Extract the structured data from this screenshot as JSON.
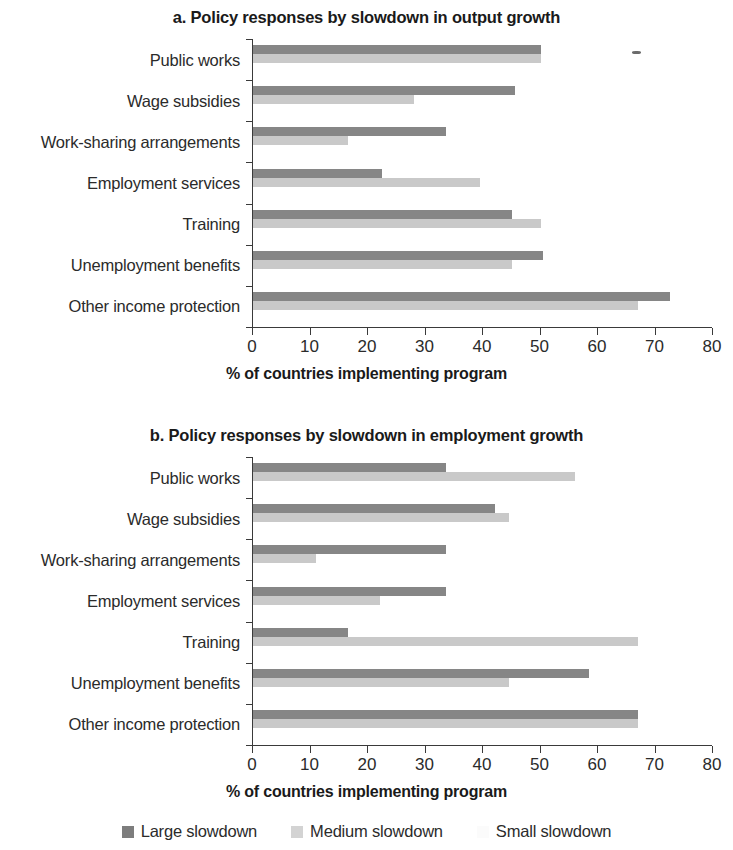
{
  "charts": [
    {
      "key": "a",
      "title": "a.  Policy responses by slowdown in output growth",
      "xlabel": "% of countries implementing program"
    },
    {
      "key": "b",
      "title": "b. Policy responses by slowdown in employment growth",
      "xlabel": "% of countries implementing program"
    }
  ],
  "legend": {
    "items": [
      {
        "label": "Large slowdown",
        "color": "#7d7d7d",
        "series": "large"
      },
      {
        "label": "Medium slowdown",
        "color": "#d3d3d3",
        "series": "medium"
      },
      {
        "label": "Small slowdown",
        "color": "#fbfbfb",
        "series": "small"
      }
    ]
  },
  "chart_data": [
    {
      "type": "bar",
      "orientation": "horizontal",
      "title": "a.  Policy responses by slowdown in output growth",
      "xlabel": "% of countries implementing program",
      "ylabel": "",
      "xlim": [
        0,
        80
      ],
      "xticks": [
        0,
        10,
        20,
        30,
        40,
        50,
        60,
        70,
        80
      ],
      "grid": false,
      "legend_position": "bottom",
      "categories": [
        "Public works",
        "Wage subsidies",
        "Work-sharing arrangements",
        "Employment services",
        "Training",
        "Unemployment benefits",
        "Other income protection"
      ],
      "series": [
        {
          "name": "Large slowdown",
          "values": [
            50,
            45.5,
            33.5,
            22.5,
            45,
            50.5,
            72.5
          ]
        },
        {
          "name": "Medium slowdown",
          "values": [
            50,
            28,
            16.5,
            39.5,
            50,
            45,
            67
          ]
        },
        {
          "name": "Small slowdown",
          "values": [
            0,
            0,
            0,
            0,
            0,
            0,
            0
          ]
        }
      ]
    },
    {
      "type": "bar",
      "orientation": "horizontal",
      "title": "b. Policy responses by slowdown in employment growth",
      "xlabel": "% of countries implementing program",
      "ylabel": "",
      "xlim": [
        0,
        80
      ],
      "xticks": [
        0,
        10,
        20,
        30,
        40,
        50,
        60,
        70,
        80
      ],
      "grid": false,
      "legend_position": "bottom",
      "categories": [
        "Public works",
        "Wage subsidies",
        "Work-sharing arrangements",
        "Employment services",
        "Training",
        "Unemployment benefits",
        "Other income protection"
      ],
      "series": [
        {
          "name": "Large slowdown",
          "values": [
            33.5,
            42,
            33.5,
            33.5,
            16.5,
            58.5,
            67
          ]
        },
        {
          "name": "Medium slowdown",
          "values": [
            56,
            44.5,
            11,
            22,
            67,
            44.5,
            67
          ]
        },
        {
          "name": "Small slowdown",
          "values": [
            0,
            0,
            0,
            0,
            0,
            0,
            0
          ]
        }
      ]
    }
  ]
}
